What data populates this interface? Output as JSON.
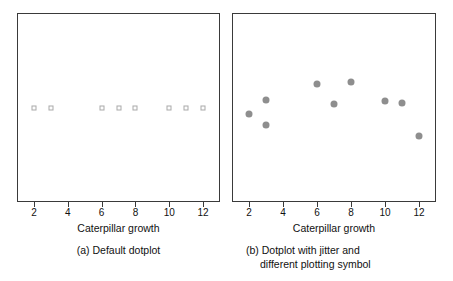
{
  "chart_data": [
    {
      "type": "scatter",
      "panel_id": "a",
      "title": "",
      "subcaption": "(a) Default dotplot",
      "xlabel": "Caterpillar growth",
      "ylabel": "",
      "xlim": [
        1,
        13
      ],
      "ylim": [
        0,
        1
      ],
      "xticks": [
        2,
        4,
        6,
        8,
        10,
        12
      ],
      "xticklabels": [
        "2",
        "4",
        "6",
        "8",
        "10",
        "12"
      ],
      "yticks": [],
      "grid": false,
      "legend": "none",
      "marker": "open-square",
      "marker_color": "#a9a9a9",
      "x": [
        2,
        3,
        6,
        7,
        8,
        10,
        11,
        12
      ],
      "y": [
        0.5,
        0.5,
        0.5,
        0.5,
        0.5,
        0.5,
        0.5,
        0.5
      ]
    },
    {
      "type": "scatter",
      "panel_id": "b",
      "title": "",
      "subcaption_line1": "(b) Dotplot with jitter and",
      "subcaption_line2": "different plotting symbol",
      "xlabel": "Caterpillar growth",
      "ylabel": "",
      "xlim": [
        1,
        13
      ],
      "ylim": [
        0,
        1
      ],
      "xticks": [
        2,
        4,
        6,
        8,
        10,
        12
      ],
      "xticklabels": [
        "2",
        "4",
        "6",
        "8",
        "10",
        "12"
      ],
      "yticks": [],
      "grid": false,
      "legend": "none",
      "marker": "filled-circle",
      "marker_color": "#8e8e8e",
      "points": [
        {
          "x": 2.0,
          "y": 0.465
        },
        {
          "x": 3.0,
          "y": 0.54
        },
        {
          "x": 3.0,
          "y": 0.405
        },
        {
          "x": 6.0,
          "y": 0.625
        },
        {
          "x": 7.0,
          "y": 0.52
        },
        {
          "x": 8.0,
          "y": 0.635
        },
        {
          "x": 10.0,
          "y": 0.535
        },
        {
          "x": 11.0,
          "y": 0.525
        },
        {
          "x": 12.0,
          "y": 0.35
        }
      ]
    }
  ],
  "panels": {
    "a": {
      "xlabel": "Caterpillar growth",
      "subcaption": "(a) Default dotplot",
      "xticklabels": [
        "2",
        "4",
        "6",
        "8",
        "10",
        "12"
      ]
    },
    "b": {
      "xlabel": "Caterpillar growth",
      "subcaption_line1": "(b) Dotplot with jitter and",
      "subcaption_line2": "different plotting symbol",
      "xticklabels": [
        "2",
        "4",
        "6",
        "8",
        "10",
        "12"
      ]
    }
  },
  "colors": {
    "frame": "#3a3a3a",
    "text": "#111111",
    "marker_a": "#a9a9a9",
    "marker_b": "#8e8e8e",
    "background": "#ffffff"
  }
}
